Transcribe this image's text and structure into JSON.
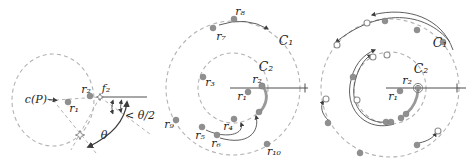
{
  "figure": {
    "type": "geometry-diagram",
    "colors": {
      "dashed": "#b3b3b3",
      "dot": "#8f8f8f",
      "line": "#4d4d4d",
      "grayline": "#8a8a8a",
      "thick": "#999999",
      "text": "#1f1f1f"
    },
    "panels": {
      "left": {
        "labels": {
          "center": "c(P)",
          "r1": "r₁",
          "r2": "r₂",
          "f2": "f₂",
          "theta": "θ",
          "angle_bound": "< θ/2"
        }
      },
      "middle": {
        "labels": {
          "c1": "C₁",
          "c2": "C₂",
          "r1": "r₁",
          "r2": "r₂",
          "r3": "r₃",
          "r4": "r₄",
          "r5": "r₅",
          "r6": "r₆",
          "r7": "r₇",
          "r8": "r₈",
          "r9": "r₉",
          "r10": "r₁₀"
        }
      },
      "right": {
        "labels": {
          "c1": "C₁",
          "c2": "C₂",
          "r1": "r₁",
          "r2": "r₂"
        }
      }
    }
  }
}
